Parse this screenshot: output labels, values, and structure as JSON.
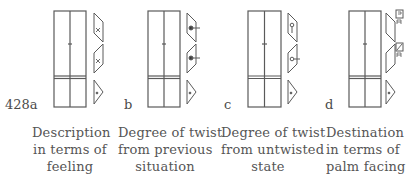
{
  "figure": {
    "number": "428",
    "panels": [
      {
        "letter": "428a",
        "caption": [
          "Description",
          "in terms of",
          "feeling"
        ],
        "symbols": [
          "pin-upper",
          "pin-lower",
          "dot"
        ]
      },
      {
        "letter": "b",
        "caption": [
          "Degree of twist",
          "from previous",
          "situation"
        ],
        "symbols": [
          "black-pin-tick",
          "black-pin-tick",
          "dot"
        ]
      },
      {
        "letter": "c",
        "caption": [
          "Degree of twist",
          "from untwisted",
          "state"
        ],
        "symbols": [
          "white-pin-vertical",
          "white-pin-tick",
          "dot"
        ]
      },
      {
        "letter": "d",
        "caption": [
          "Destination",
          "in terms of",
          "palm facing"
        ],
        "symbols": [
          "palm-facing-sign",
          "palm-facing-sign-diagonal",
          "dot"
        ]
      }
    ]
  },
  "colors": {
    "ink": "#4a4a4a",
    "staff": "#5a5a5a",
    "background": "#ffffff"
  }
}
